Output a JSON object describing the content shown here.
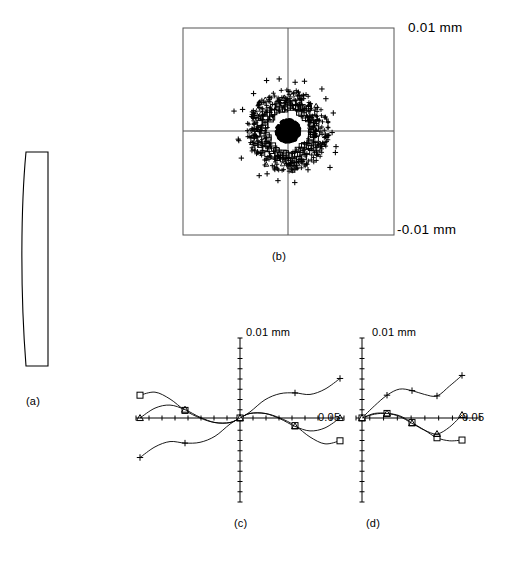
{
  "figure": {
    "background_color": "#ffffff",
    "line_color": "#000000",
    "frame_color": "#555555"
  },
  "captions": {
    "a": "(a)",
    "b": "(b)",
    "c": "(c)",
    "d": "(d)"
  },
  "panel_a": {
    "name": "lens-element-cross-section",
    "description": "Single meniscus lens element drawn in cross-section, flat right face, slightly convex left face"
  },
  "panel_b": {
    "name": "spot-diagram",
    "scale_top_label": "0.01 mm",
    "scale_bottom_label": "-0.01 mm",
    "frame": {
      "x": 183,
      "y": 28,
      "width": 211,
      "height": 207
    },
    "crosshair": {
      "cx": 288,
      "cy": 131
    }
  },
  "panel_c": {
    "name": "ray-fan-tangential",
    "y_axis_label": "0.01 mm",
    "x_axis_label": "0.05"
  },
  "panel_d": {
    "name": "ray-fan-sagittal",
    "y_axis_label": "0.01 mm",
    "x_axis_label": "0.05"
  },
  "chart_data": [
    {
      "id": "spot-diagram",
      "type": "scatter",
      "title": "(b) Spot diagram",
      "xlabel": "",
      "ylabel": "",
      "xlim": [
        -0.01,
        0.01
      ],
      "ylim": [
        -0.01,
        0.01
      ],
      "grid": false,
      "axes": "crosshair",
      "annotations": [
        "0.01 mm",
        "-0.01 mm"
      ],
      "series": [
        {
          "name": "core",
          "marker": "filled-dot",
          "description": "dense saturated black core of ray intersections near the centroid",
          "radius_mm": 0.0011,
          "count": 420
        },
        {
          "name": "square-ring",
          "marker": "square",
          "description": "open square markers forming a ring around the core",
          "radius_mm": 0.0022,
          "count": 54
        },
        {
          "name": "mid-plus-cloud",
          "marker": "plus",
          "description": "dense plus-marker annulus outside the square ring",
          "radius_mm": 0.0032,
          "count": 300
        },
        {
          "name": "outer-plus",
          "marker": "plus",
          "description": "sparse outer plus markers at the largest radii",
          "radius_mm": 0.0048,
          "count": 22
        }
      ]
    },
    {
      "id": "ray-fan-tangential",
      "type": "line",
      "title": "(c) Tangential ray fan",
      "xlabel": "0.05",
      "ylabel": "0.01 mm",
      "xlim": [
        -1,
        1
      ],
      "ylim": [
        -0.01,
        0.01
      ],
      "grid": false,
      "axes": "crosshair-with-ticks",
      "x": [
        -1.0,
        -0.85,
        -0.7,
        -0.55,
        -0.4,
        -0.25,
        -0.1,
        0.0,
        0.1,
        0.25,
        0.4,
        0.55,
        0.7,
        0.85,
        1.0
      ],
      "series": [
        {
          "name": "plus-curve",
          "marker": "plus",
          "values": [
            -0.0052,
            -0.0038,
            -0.0031,
            -0.0033,
            -0.0032,
            -0.0024,
            -0.0008,
            0.0,
            0.0008,
            0.0024,
            0.0032,
            0.0033,
            0.0031,
            0.0038,
            0.0052
          ]
        },
        {
          "name": "square-curve",
          "marker": "square",
          "values": [
            0.003,
            0.0034,
            0.0025,
            0.001,
            0.0,
            -0.0006,
            -0.0006,
            0.0,
            0.0006,
            0.0006,
            0.0,
            -0.001,
            -0.0025,
            -0.0034,
            -0.003
          ]
        },
        {
          "name": "triangle-curve",
          "marker": "triangle",
          "values": [
            0.0,
            0.0013,
            0.0017,
            0.0011,
            0.0001,
            -0.0006,
            -0.0006,
            0.0,
            0.0006,
            0.0006,
            -0.0001,
            -0.0011,
            -0.0017,
            -0.0013,
            0.0
          ]
        }
      ]
    },
    {
      "id": "ray-fan-sagittal",
      "type": "line",
      "title": "(d) Sagittal ray fan",
      "xlabel": "0.05",
      "ylabel": "0.01 mm",
      "xlim": [
        0,
        1
      ],
      "ylim": [
        -0.01,
        0.01
      ],
      "grid": false,
      "axes": "crosshair-with-ticks",
      "x": [
        0.0,
        0.125,
        0.25,
        0.375,
        0.5,
        0.625,
        0.75,
        0.875,
        1.0
      ],
      "series": [
        {
          "name": "plus-curve",
          "marker": "plus",
          "values": [
            0.0,
            0.0016,
            0.003,
            0.0038,
            0.0036,
            0.0031,
            0.0029,
            0.0042,
            0.0056
          ]
        },
        {
          "name": "square-curve",
          "marker": "square",
          "values": [
            0.0,
            0.0006,
            0.0006,
            0.0003,
            -0.0006,
            -0.0016,
            -0.0026,
            -0.003,
            -0.0029
          ]
        },
        {
          "name": "triangle-curve",
          "marker": "triangle",
          "values": [
            0.0,
            0.0005,
            0.0006,
            0.0002,
            -0.0007,
            -0.0016,
            -0.0021,
            -0.0012,
            0.0004
          ]
        }
      ]
    }
  ]
}
